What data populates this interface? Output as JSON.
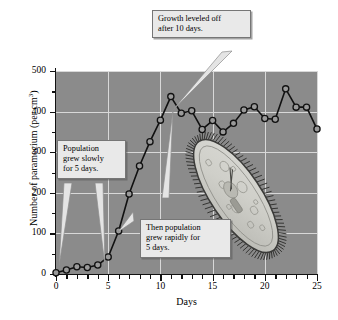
{
  "figure": {
    "background_color": "#ffffff",
    "plot_background_color": "#8b8b8b",
    "gridline_color": "#d8d8d8",
    "line_color": "#111111",
    "marker_fill_color": "#9a9a9a",
    "callout_fill_color": "#e9e9e9",
    "callout_border_color": "#767676"
  },
  "annotations": [
    {
      "name": "growth-leveled-callout",
      "lines": [
        "Growth leveled off",
        "after 10 days."
      ],
      "text": "Growth leveled off after 10 days."
    },
    {
      "name": "grew-slowly-callout",
      "lines": [
        "Population",
        "grew slowly",
        "for 5 days."
      ],
      "text": "Population grew slowly for 5 days."
    },
    {
      "name": "grew-rapidly-callout",
      "lines": [
        "Then population",
        "grew rapidly for",
        "5 days."
      ],
      "text": "Then population grew rapidly for 5 days."
    }
  ],
  "illustration": {
    "name": "paramecium-illustration",
    "label": "paramecium"
  },
  "chart_data": {
    "type": "line",
    "title": "",
    "subtitle": "",
    "xlabel": "Days",
    "ylabel": "Number of paramecium  (per cm",
    "ylabel_superscript": "3",
    "ylabel_suffix": ")",
    "xlim": [
      0,
      25
    ],
    "ylim": [
      0,
      500
    ],
    "xticks": [
      0,
      5,
      10,
      15,
      20,
      25
    ],
    "yticks": [
      0,
      100,
      200,
      300,
      400,
      500
    ],
    "xtick_labels": [
      "0",
      "5",
      "10",
      "15",
      "20",
      "25"
    ],
    "ytick_labels": [
      "0",
      "100",
      "200",
      "300",
      "400",
      "500"
    ],
    "x_minor_ticks": [
      1,
      2,
      3,
      4,
      6,
      7,
      8,
      9,
      11,
      12,
      13,
      14,
      16,
      17,
      18,
      19,
      21,
      22,
      23,
      24
    ],
    "y_minor_ticks": [
      50,
      150,
      250,
      350,
      450
    ],
    "grid": true,
    "legend": "none",
    "markers": "circle",
    "series": [
      {
        "name": "Paramecium population",
        "x": [
          0,
          1,
          2,
          3,
          4,
          5,
          6,
          7,
          8,
          9,
          10,
          11,
          12,
          13,
          14,
          15,
          16,
          17,
          18,
          19,
          20,
          21,
          22,
          23,
          24,
          25
        ],
        "values": [
          3,
          10,
          18,
          16,
          22,
          42,
          106,
          197,
          266,
          326,
          379,
          437,
          396,
          402,
          356,
          378,
          350,
          371,
          404,
          412,
          383,
          381,
          456,
          411,
          411,
          357
        ]
      }
    ]
  }
}
